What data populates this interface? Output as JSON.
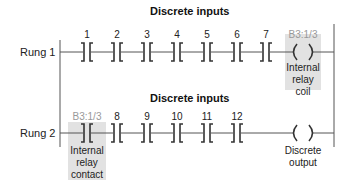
{
  "diagram": {
    "type": "ladder-logic",
    "colors": {
      "line": "#555555",
      "shade": "#e2e2e2",
      "address": "#999999"
    },
    "rungs": [
      {
        "label": "Rung 1",
        "section_title": "Discrete inputs",
        "contacts": [
          "1",
          "2",
          "3",
          "4",
          "5",
          "6",
          "7"
        ],
        "output": {
          "address": "B3:1/3",
          "caption_lines": [
            "Internal",
            "relay",
            "coil"
          ]
        }
      },
      {
        "label": "Rung 2",
        "section_title": "Discrete inputs",
        "first_contact": {
          "address": "B3:1/3",
          "caption_lines": [
            "Internal",
            "relay",
            "contact"
          ]
        },
        "contacts": [
          "8",
          "9",
          "10",
          "11",
          "12"
        ],
        "output": {
          "caption_lines": [
            "Discrete",
            "output"
          ]
        }
      }
    ]
  }
}
